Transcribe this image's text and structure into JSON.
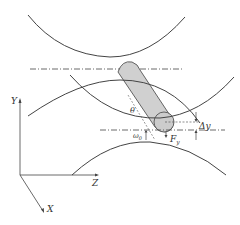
{
  "figure": {
    "colors": {
      "stroke": "#444444",
      "roller_fill": "#d0d0d0",
      "roller_stroke": "#555555",
      "background": "#ffffff"
    },
    "labels": {
      "theta": "θ",
      "delta_y": "Δy",
      "force_y": "F",
      "force_y_sub": "y",
      "omega0": "ω",
      "omega0_sub": "0",
      "axis_y": "Y",
      "axis_z": "Z",
      "axis_x": "X"
    }
  }
}
